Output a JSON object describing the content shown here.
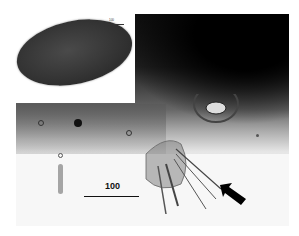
{
  "figure": {
    "main_scale_label": "100",
    "inset_scale_label": "100",
    "annotations": [
      {
        "type": "arrow",
        "pointing": "up-left",
        "color": "#000000"
      }
    ],
    "panels": [
      {
        "name": "inset",
        "content": "egg micrograph"
      },
      {
        "name": "main",
        "content": "larval structure micrograph"
      }
    ]
  }
}
